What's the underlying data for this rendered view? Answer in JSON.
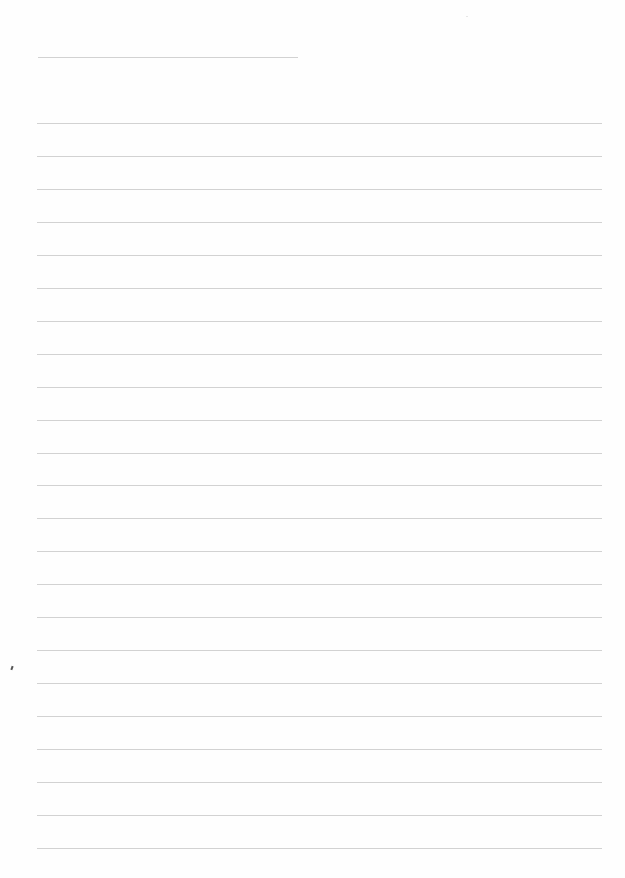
{
  "page": {
    "type": "lined-paper",
    "background": "#ffffff",
    "line_color": "#d2d2d2",
    "title_line": {
      "x1": 38,
      "x2": 298,
      "y": 57
    },
    "rules": {
      "x1": 37,
      "x2": 602,
      "start_y": 123,
      "spacing": 32.95,
      "count": 23
    },
    "marks": [
      {
        "x": 11,
        "y": 666,
        "type": "pen-mark"
      }
    ],
    "text": []
  }
}
